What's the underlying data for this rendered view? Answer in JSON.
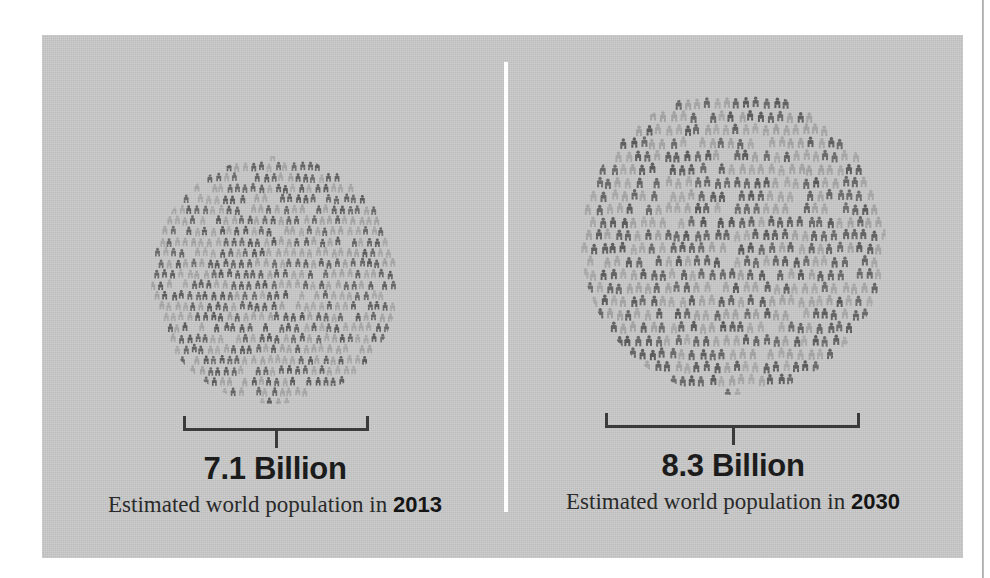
{
  "poster": {
    "background_color": "#ffffff",
    "panel_color": "#c9c9c9",
    "divider_color": "#ffffff",
    "text_color": "#1c1c1c",
    "figure_dark_color": "#5a5a5a",
    "figure_light_color": "#9a9a9a",
    "bracket_color": "#3b3b3b"
  },
  "panels": [
    {
      "id": "population-2013",
      "headline": "7.1 Billion",
      "caption_prefix": "Estimated world population in ",
      "year": "2013",
      "circle": {
        "center_x": 275,
        "center_y": 280,
        "diameter": 248
      },
      "bracket": {
        "left": 183,
        "right": 369,
        "y": 416
      }
    },
    {
      "id": "population-2030",
      "headline": "8.3 Billion",
      "caption_prefix": "Estimated world population in ",
      "year": "2030",
      "circle": {
        "center_x": 733,
        "center_y": 242,
        "diameter": 305
      },
      "bracket": {
        "left": 605,
        "right": 860,
        "y": 413
      }
    }
  ],
  "chart_data": {
    "type": "bar",
    "title": "Estimated world population",
    "subtitle": "Proportional area circles built from human pictograms",
    "xlabel": "Year",
    "ylabel": "Population (billions)",
    "categories": [
      "2013",
      "2030"
    ],
    "values": [
      7.1,
      8.3
    ],
    "units": "billion people",
    "value_labels": [
      "7.1 Billion",
      "8.3 Billion"
    ],
    "annotations": [
      "Estimated world population in 2013",
      "Estimated world population in 2030"
    ],
    "legend": [],
    "grid": false,
    "encoding": "circle area scaled to population; each glyph is a human figure"
  }
}
